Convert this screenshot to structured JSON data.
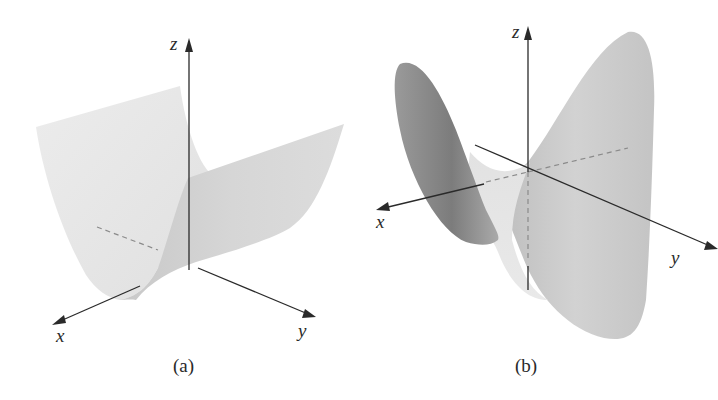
{
  "figure": {
    "panels": [
      {
        "id": "a",
        "caption": "(a)",
        "surface": "parabolic-cylinder",
        "axes": {
          "x": "x",
          "y": "y",
          "z": "z"
        }
      },
      {
        "id": "b",
        "caption": "(b)",
        "surface": "hyperbolic-paraboloid-saddle",
        "axes": {
          "x": "x",
          "y": "y",
          "z": "z"
        }
      }
    ],
    "colors": {
      "axis": "#2a2a2a",
      "surface_light": "#e6e6e6",
      "surface_mid": "#cfcfcf",
      "surface_dark": "#8c8c8c",
      "background": "#ffffff"
    }
  }
}
